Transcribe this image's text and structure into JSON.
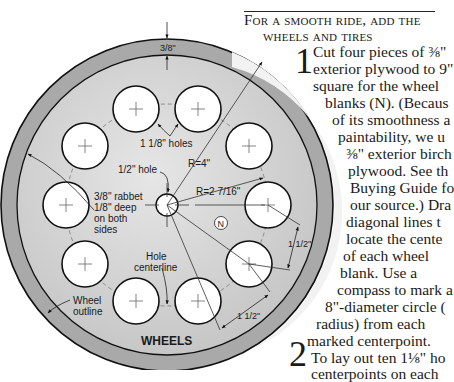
{
  "article": {
    "heading_line1": "For a smooth ride, add the",
    "heading_line2": "wheels and tires",
    "step1_number": "1",
    "step2_number": "2",
    "lines": [
      "Cut four pieces of ⅜\"",
      "exterior plywood to 9\"",
      "square for the wheel",
      "blanks (N). (Becaus",
      "of its smoothness a",
      "paintability, we u",
      "⅜\" exterior birch",
      "plywood. See th",
      "Buying Guide fo",
      "our source.) Dra",
      "diagonal lines t",
      "locate the cente",
      "of each wheel",
      "blank. Use a",
      "compass to mark a",
      "8\"-diameter circle (",
      "radius) from each",
      "marked centerpoint.",
      "To lay out ten 1⅛\" ho",
      "centerpoints on each"
    ]
  },
  "diagram": {
    "title": "WHEELS",
    "labels": {
      "rabbet_width": "3/8\"",
      "holes": "1 1/8\" holes",
      "center_hole": "1/2\" hole",
      "outer_radius": "R=4\"",
      "hole_circle_radius": "R=2 7/16\"",
      "rabbet_note_1": "3/8\" rabbet",
      "rabbet_note_2": "1/8\" deep",
      "rabbet_note_3": "on both",
      "rabbet_note_4": "sides",
      "part_letter": "N",
      "hole_centerline_1": "Hole",
      "hole_centerline_2": "centerline",
      "wheel_outline_1": "Wheel",
      "wheel_outline_2": "outline",
      "spacing_1": "1 1/2\"",
      "spacing_2": "1 1/2\""
    },
    "colors": {
      "rabbet_ring": "#a9a9a9",
      "wheel_face": "#d2d2d2",
      "hole_fill": "#ffffff",
      "outline": "#111111"
    }
  }
}
